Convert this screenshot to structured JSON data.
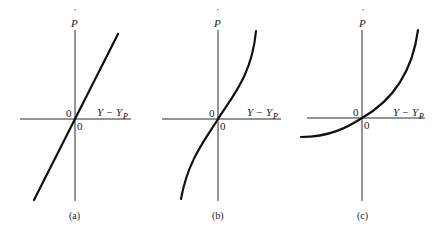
{
  "figure": {
    "panels": [
      {
        "id": "a",
        "caption": "(a)",
        "y_axis_label": "P",
        "y_axis_label_dot": "˙",
        "x_axis_label_main": "Y − Y",
        "x_axis_label_sub": "P",
        "origin_label_left": "0",
        "origin_label_right": "0",
        "curve_shape": "straight line through origin"
      },
      {
        "id": "b",
        "caption": "(b)",
        "y_axis_label": "P",
        "y_axis_label_dot": "˙",
        "x_axis_label_main": "Y − Y",
        "x_axis_label_sub": "P",
        "origin_label_left": "0",
        "origin_label_right": "0",
        "curve_shape": "S-shaped (cubic-like) curve through origin"
      },
      {
        "id": "c",
        "caption": "(c)",
        "y_axis_label": "P",
        "y_axis_label_dot": "˙",
        "x_axis_label_main": "Y − Y",
        "x_axis_label_sub": "P",
        "origin_label_left": "0",
        "origin_label_right": "0",
        "curve_shape": "convex (exponential-like) curve through origin"
      }
    ],
    "colors": {
      "ink": "#111111",
      "background": "#ffffff"
    }
  }
}
